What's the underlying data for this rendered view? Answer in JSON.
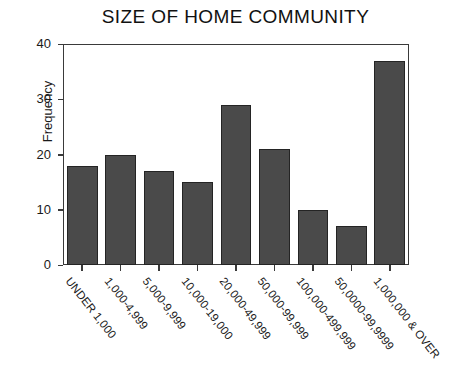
{
  "chart_data": {
    "type": "bar",
    "title": "SIZE OF HOME COMMUNITY",
    "xlabel": "",
    "ylabel": "Frequency",
    "ylim": [
      0,
      40
    ],
    "yticks": [
      0,
      10,
      20,
      30,
      40
    ],
    "grid": false,
    "legend": null,
    "bar_color": "#4a4a4a",
    "bar_edge_color": "#242424",
    "background_color": "#ffffff",
    "axis_color": "#3a3a3a",
    "categories": [
      "UNDER 1,000",
      "1,000-4,999",
      "5,000-9,999",
      "10,000-19,000",
      "20,000-49,999",
      "50,000-99,999",
      "100,000-499,999",
      "50,0000-99,9999",
      "1,000,000 & OVER"
    ],
    "values": [
      18,
      20,
      17,
      15,
      29,
      21,
      10,
      7,
      37
    ]
  }
}
